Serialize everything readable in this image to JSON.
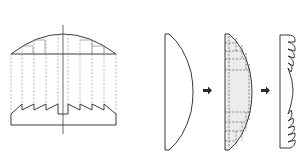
{
  "diagram": {
    "type": "fresnel-lens-construction",
    "panels": [
      {
        "id": "projection",
        "description": "Cross-section projection of a plano-convex lens into a sawtooth Fresnel profile"
      },
      {
        "id": "sequence",
        "description": "Plano-convex lens → segmented lens with removed material → Fresnel lens"
      }
    ],
    "colors": {
      "line": "#3a3a3a",
      "dashed": "#8a8a8a",
      "fill_removed": "#ececec",
      "arrow": "#2a2a2a",
      "background": "#ffffff"
    },
    "icons": {
      "arrow_1": "right-arrow-icon",
      "arrow_2": "right-arrow-icon"
    }
  }
}
